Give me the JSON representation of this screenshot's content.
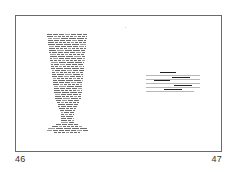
{
  "spread": {
    "left_page": {
      "page_number": "46",
      "figure": {
        "type": "calligram",
        "shape": "goblet",
        "description": "Text set in the shape of a stemmed goblet/vase"
      }
    },
    "right_page": {
      "page_number": "47",
      "text_block": {
        "line_count": 6,
        "underlined_segments": 5
      }
    }
  },
  "colors": {
    "frame": "#6a6a6a",
    "text": "#333333",
    "underline": "#222222"
  }
}
